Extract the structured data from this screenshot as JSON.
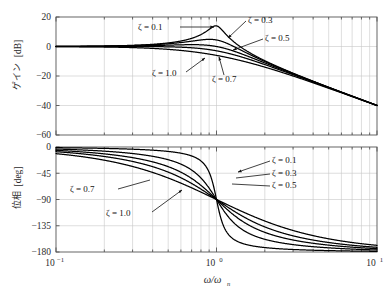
{
  "figure": {
    "title": "",
    "background": "#ffffff",
    "curve_color": "#000000",
    "grid_color": "#c8c8c8",
    "axis_color": "#555555"
  },
  "xaxis": {
    "label": "ω/ω",
    "label_sub": "n",
    "scale": "log",
    "min": 0.1,
    "max": 10,
    "ticks": [
      {
        "value": 0.1,
        "mantissa": "10",
        "exponent": "−1"
      },
      {
        "value": 1,
        "mantissa": "10",
        "exponent": "0"
      },
      {
        "value": 10,
        "mantissa": "10",
        "exponent": "1"
      }
    ]
  },
  "gain_panel": {
    "ylabel_jp": "ゲイン",
    "ylabel_unit": "[dB]",
    "ymin": -60,
    "ymax": 20,
    "yticks": [
      "20",
      "0",
      "−20",
      "−40",
      "−60"
    ],
    "ytick_values": [
      20,
      0,
      -20,
      -40,
      -60
    ],
    "annotations": [
      {
        "label": "ζ = 0.1",
        "zeta": 0.1
      },
      {
        "label": "ζ = 0.3",
        "zeta": 0.3
      },
      {
        "label": "ζ = 0.5",
        "zeta": 0.5
      },
      {
        "label": "ζ = 0.7",
        "zeta": 0.7
      },
      {
        "label": "ζ = 1.0",
        "zeta": 1.0
      }
    ]
  },
  "phase_panel": {
    "ylabel_jp": "位相",
    "ylabel_unit": "[deg]",
    "ymin": -180,
    "ymax": 0,
    "yticks": [
      "0",
      "−45",
      "−90",
      "−135",
      "−180"
    ],
    "ytick_values": [
      0,
      -45,
      -90,
      -135,
      -180
    ],
    "annotations": [
      {
        "label": "ζ = 0.1",
        "zeta": 0.1
      },
      {
        "label": "ζ = 0.3",
        "zeta": 0.3
      },
      {
        "label": "ζ = 0.5",
        "zeta": 0.5
      },
      {
        "label": "ζ = 0.7",
        "zeta": 0.7
      },
      {
        "label": "ζ = 1.0",
        "zeta": 1.0
      }
    ]
  },
  "chart_data": {
    "type": "line",
    "xlabel": "ω/ωn",
    "xscale": "log",
    "xlim": [
      0.1,
      10
    ],
    "panels": [
      {
        "name": "gain",
        "ylabel": "ゲイン [dB]",
        "ylim": [
          -60,
          20
        ],
        "yticks": [
          20,
          0,
          -20,
          -40,
          -60
        ],
        "grid": true,
        "series": [
          {
            "name": "ζ = 0.1",
            "zeta": 0.1,
            "x": [
              0.1,
              0.2,
              0.3,
              0.5,
              0.7,
              0.9,
              1.0,
              1.1,
              1.3,
              1.5,
              2.0,
              3.0,
              5.0,
              7.0,
              10.0
            ],
            "values": [
              0.09,
              0.37,
              0.92,
              2.6,
              5.7,
              11.3,
              13.98,
              10.6,
              5.0,
              1.3,
              -4.6,
              -12.9,
              -23.1,
              -29.3,
              -38.1
            ]
          },
          {
            "name": "ζ = 0.3",
            "zeta": 0.3,
            "x": [
              0.1,
              0.2,
              0.3,
              0.5,
              0.7,
              0.9,
              1.0,
              1.1,
              1.3,
              1.5,
              2.0,
              3.0,
              5.0,
              7.0,
              10.0
            ],
            "values": [
              0.07,
              0.31,
              0.74,
              2.0,
              4.0,
              5.2,
              4.44,
              3.1,
              0.4,
              -1.9,
              -6.5,
              -13.6,
              -23.3,
              -29.4,
              -38.2
            ]
          },
          {
            "name": "ζ = 0.5",
            "zeta": 0.5,
            "x": [
              0.1,
              0.2,
              0.3,
              0.5,
              0.7,
              0.9,
              1.0,
              1.1,
              1.3,
              1.5,
              2.0,
              3.0,
              5.0,
              7.0,
              10.0
            ],
            "values": [
              0.04,
              0.17,
              0.38,
              0.92,
              1.43,
              1.06,
              0.0,
              -1.3,
              -3.8,
              -5.9,
              -10.0,
              -16.1,
              -24.2,
              -29.9,
              -38.3
            ]
          },
          {
            "name": "ζ = 0.7",
            "zeta": 0.7,
            "x": [
              0.1,
              0.2,
              0.3,
              0.5,
              0.7,
              0.9,
              1.0,
              1.1,
              1.3,
              1.5,
              2.0,
              3.0,
              5.0,
              7.0,
              10.0
            ],
            "values": [
              0.0,
              -0.02,
              -0.06,
              -0.18,
              -0.56,
              -1.74,
              -3.1,
              -4.6,
              -7.3,
              -9.4,
              -13.1,
              -18.3,
              -25.4,
              -30.6,
              -38.6
            ]
          },
          {
            "name": "ζ = 1.0",
            "zeta": 1.0,
            "x": [
              0.1,
              0.2,
              0.3,
              0.5,
              0.7,
              0.9,
              1.0,
              1.1,
              1.3,
              1.5,
              2.0,
              3.0,
              5.0,
              7.0,
              10.0
            ],
            "values": [
              -0.09,
              -0.34,
              -0.75,
              -1.94,
              -3.4,
              -5.0,
              -6.02,
              -7.0,
              -8.9,
              -10.6,
              -13.98,
              -20.0,
              -27.1,
              -31.9,
              -39.2
            ]
          }
        ]
      },
      {
        "name": "phase",
        "ylabel": "位相 [deg]",
        "ylim": [
          -180,
          0
        ],
        "yticks": [
          0,
          -45,
          -90,
          -135,
          -180
        ],
        "grid": true,
        "series": [
          {
            "name": "ζ = 0.1",
            "zeta": 0.1,
            "x": [
              0.1,
              0.3,
              0.5,
              0.7,
              0.9,
              1.0,
              1.1,
              1.3,
              1.5,
              2.0,
              3.0,
              5.0,
              10.0
            ],
            "values": [
              -1.2,
              -3.8,
              -7.6,
              -15.6,
              -46.4,
              -90.0,
              -133.6,
              -164.6,
              -170.4,
              -172.4,
              -175.7,
              -177.6,
              -178.8
            ]
          },
          {
            "name": "ζ = 0.3",
            "zeta": 0.3,
            "x": [
              0.1,
              0.3,
              0.5,
              0.7,
              0.9,
              1.0,
              1.1,
              1.3,
              1.5,
              2.0,
              3.0,
              5.0,
              10.0
            ],
            "values": [
              -3.5,
              -11.3,
              -21.8,
              -40.2,
              -72.4,
              -90.0,
              -107.6,
              -137.9,
              -152.1,
              -165.1,
              -172.9,
              -176.4,
              -178.3
            ]
          },
          {
            "name": "ζ = 0.5",
            "zeta": 0.5,
            "x": [
              0.1,
              0.3,
              0.5,
              0.7,
              0.9,
              1.0,
              1.1,
              1.3,
              1.5,
              2.0,
              3.0,
              5.0,
              10.0
            ],
            "values": [
              -5.8,
              -18.4,
              -33.7,
              -56.4,
              -81.8,
              -90.0,
              -98.2,
              -123.0,
              -140.2,
              -158.2,
              -169.0,
              -174.1,
              -177.1
            ]
          },
          {
            "name": "ζ = 0.7",
            "zeta": 0.7,
            "x": [
              0.1,
              0.3,
              0.5,
              0.7,
              0.9,
              1.0,
              1.1,
              1.3,
              1.5,
              2.0,
              3.0,
              5.0,
              10.0
            ],
            "values": [
              -8.1,
              -25.3,
              -43.0,
              -64.6,
              -85.3,
              -90.0,
              -101.4,
              -123.0,
              -137.5,
              -156.9,
              -168.0,
              -173.7,
              -176.8
            ]
          },
          {
            "name": "ζ = 1.0",
            "zeta": 1.0,
            "x": [
              0.1,
              0.3,
              0.5,
              0.7,
              0.9,
              1.0,
              1.1,
              1.3,
              1.5,
              2.0,
              3.0,
              5.0,
              10.0
            ],
            "values": [
              -11.4,
              -34.7,
              -53.1,
              -74.1,
              -86.2,
              -90.0,
              -105.9,
              -126.9,
              -141.4,
              -159.0,
              -170.1,
              -175.4,
              -178.1
            ]
          }
        ]
      }
    ],
    "legend_position": "inline-annotations"
  }
}
